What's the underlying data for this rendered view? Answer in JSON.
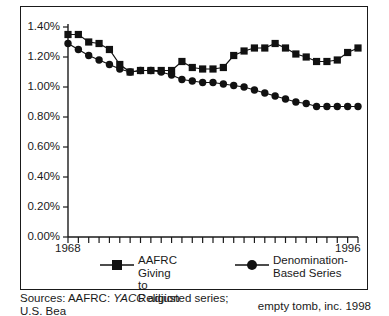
{
  "chart_data": {
    "type": "line",
    "title": "",
    "subtitle": "",
    "xlabel": "",
    "ylabel": "",
    "grid": false,
    "legend_position": "bottom",
    "xlim": [
      1968,
      1996
    ],
    "ylim": [
      0.0,
      1.4
    ],
    "ytick_values": [
      0.0,
      0.2,
      0.4,
      0.6,
      0.8,
      1.0,
      1.2,
      1.4
    ],
    "ytick_labels": [
      "0.00%",
      "0.20%",
      "0.40%",
      "0.60%",
      "0.80%",
      "1.00%",
      "1.20%",
      "1.40%"
    ],
    "xtick_labels": [
      "1968",
      "1996"
    ],
    "x": [
      1968,
      1969,
      1970,
      1971,
      1972,
      1973,
      1974,
      1975,
      1976,
      1977,
      1978,
      1979,
      1980,
      1981,
      1982,
      1983,
      1984,
      1985,
      1986,
      1987,
      1988,
      1989,
      1990,
      1991,
      1992,
      1993,
      1994,
      1995,
      1996
    ],
    "series": [
      {
        "name": "AAFRC Giving to Religion",
        "marker": "square",
        "values": [
          1.35,
          1.35,
          1.3,
          1.29,
          1.25,
          1.15,
          1.1,
          1.11,
          1.11,
          1.11,
          1.11,
          1.17,
          1.13,
          1.12,
          1.12,
          1.13,
          1.21,
          1.24,
          1.26,
          1.26,
          1.29,
          1.26,
          1.22,
          1.2,
          1.17,
          1.17,
          1.18,
          1.23,
          1.26
        ]
      },
      {
        "name": "Denomination-Based Series",
        "marker": "circle",
        "values": [
          1.29,
          1.25,
          1.21,
          1.18,
          1.15,
          1.12,
          1.1,
          1.11,
          1.11,
          1.1,
          1.08,
          1.05,
          1.04,
          1.03,
          1.03,
          1.02,
          1.01,
          1.0,
          0.98,
          0.96,
          0.94,
          0.92,
          0.9,
          0.89,
          0.87,
          0.87,
          0.87,
          0.87,
          0.87
        ]
      }
    ]
  },
  "axis": {
    "y_labels": [
      "1.40%",
      "1.20%",
      "1.00%",
      "0.80%",
      "0.60%",
      "0.40%",
      "0.20%",
      "0.00%"
    ],
    "x_start_label": "1968",
    "x_end_label": "1996"
  },
  "legend": {
    "items": [
      {
        "label": "AAFRC Giving to\nReligion",
        "marker": "square-marker"
      },
      {
        "label": "Denomination-\nBased Series",
        "marker": "circle-marker"
      }
    ]
  },
  "footer": {
    "source_prefix": "Sources: AAFRC: ",
    "source_emphasis": "YACC",
    "source_suffix": " adjusted series;",
    "source_second_line": "U.S. Bea",
    "credit": "empty tomb, inc. 1998"
  },
  "colors": {
    "ink": "#1a1a1a",
    "marker": "#111111",
    "background": "#ffffff"
  }
}
